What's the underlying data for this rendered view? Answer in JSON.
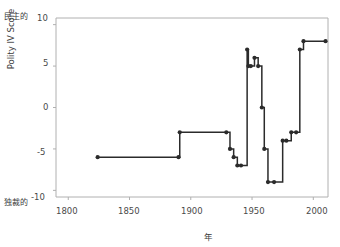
{
  "chart_data": {
    "type": "line",
    "title": "",
    "xlabel": "年",
    "ylabel": "Polity IV Score",
    "xlim": [
      1790,
      2012
    ],
    "ylim": [
      -10.8,
      10.8
    ],
    "xticks": [
      1800,
      1850,
      1900,
      1950,
      2000
    ],
    "xtick_labels": [
      "1800",
      "1850",
      "1900",
      "1950",
      "2000"
    ],
    "yticks": [
      10,
      5,
      0,
      -5,
      -10
    ],
    "ytick_labels": [
      "10",
      "5",
      "0",
      "-5",
      "-10"
    ],
    "grid": false,
    "legend": null,
    "pole_label_top": "民主的",
    "pole_label_bottom": "独裁的",
    "series": [
      {
        "name": "Polity IV Score",
        "color": "#2b2b2b",
        "marker": "o",
        "drawstyle": "steps-post",
        "x": [
          1824,
          1890,
          1891,
          1929,
          1932,
          1935,
          1938,
          1941,
          1946,
          1947,
          1949,
          1952,
          1955,
          1958,
          1960,
          1963,
          1968,
          1975,
          1978,
          1982,
          1986,
          1989,
          1992,
          2010
        ],
        "y": [
          -6,
          -6,
          -3,
          -3,
          -5,
          -6,
          -7,
          -7,
          7,
          5,
          5,
          6,
          5,
          0,
          -5,
          -9,
          -9,
          -4,
          -4,
          -3,
          -3,
          7,
          8,
          8
        ]
      }
    ]
  },
  "figure": {
    "background": "#ffffff",
    "axis_color": "#b0b0b0",
    "text_color": "#3b3b3b",
    "line_color": "#2b2b2b"
  }
}
